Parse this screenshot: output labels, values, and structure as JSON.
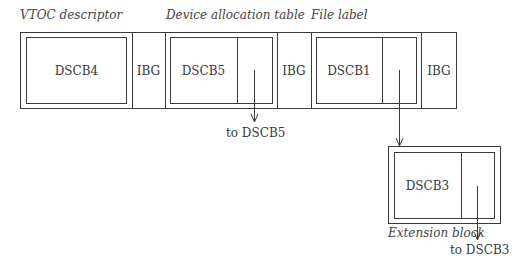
{
  "captions": {
    "vtoc": "VTOC descriptor",
    "device_allocation": "Device allocation table",
    "file_label": "File label",
    "extension_block": "Extension block"
  },
  "track": {
    "blocks": [
      {
        "id": "dscb4",
        "label": "DSCB4"
      },
      {
        "id": "ibg1",
        "label": "IBG"
      },
      {
        "id": "dscb5",
        "label": "DSCB5"
      },
      {
        "id": "ibg2",
        "label": "IBG"
      },
      {
        "id": "dscb1",
        "label": "DSCB1"
      },
      {
        "id": "ibg3",
        "label": "IBG"
      }
    ]
  },
  "extension": {
    "label": "DSCB3"
  },
  "pointers": {
    "to_dscb5": "to DSCB5",
    "to_dscb3": "to DSCB3"
  },
  "colors": {
    "line": "#3a3a3a",
    "background": "#ffffff"
  }
}
